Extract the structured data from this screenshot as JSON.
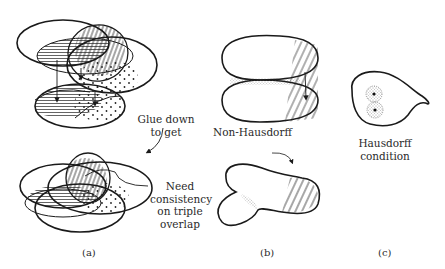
{
  "figure": {
    "panels": [
      {
        "id": "a",
        "caption": "(a)",
        "labels": {
          "glue_line1": "Glue down",
          "glue_line2": "to get",
          "need_line1": "Need",
          "need_line2": "consistency",
          "need_line3": "on triple",
          "need_line4": "overlap"
        },
        "description": "Three overlapping ellipses (charts) with hatched and dotted overlap regions, glued down into a single overlapping configuration"
      },
      {
        "id": "b",
        "caption": "(b)",
        "labels": {
          "non_hausdorff": "Non-Hausdorff"
        },
        "description": "Two stacked blobs glued along a hatched region forming a non-Hausdorff space"
      },
      {
        "id": "c",
        "caption": "(c)",
        "labels": {
          "line1": "Hausdorff",
          "line2": "condition"
        },
        "description": "Teardrop-shaped region with two points separated by disjoint dotted neighbourhoods"
      }
    ],
    "colors": {
      "ink": "#1a1a1a",
      "background": "#ffffff"
    }
  }
}
